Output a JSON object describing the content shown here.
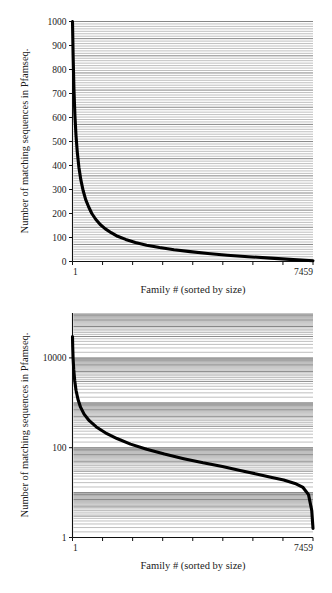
{
  "figure": {
    "panels": [
      {
        "id": "linear-panel",
        "chart_data": {
          "type": "line",
          "title": "",
          "xlabel": "Family # (sorted by size)",
          "ylabel": "Number of matching sequences in Pfamseq.",
          "yscale": "linear",
          "xlim": [
            1,
            7459
          ],
          "ylim": [
            0,
            1000
          ],
          "ytick_labels": [
            "1000",
            "900",
            "800",
            "700",
            "600",
            "500",
            "400",
            "300",
            "200",
            "100",
            "0"
          ],
          "ytick_values": [
            1000,
            900,
            800,
            700,
            600,
            500,
            400,
            300,
            200,
            100,
            0
          ],
          "xtick_labels": [
            "1",
            "7459"
          ],
          "xtick_values": [
            1,
            7459
          ],
          "grid": "horizontal",
          "legend": "none",
          "series": [
            {
              "name": "Pfam family size (rank-ordered)",
              "x": [
                1,
                20,
                45,
                75,
                110,
                150,
                200,
                260,
                330,
                410,
                500,
                600,
                720,
                860,
                1020,
                1200,
                1400,
                1650,
                1950,
                2300,
                2700,
                3150,
                3650,
                4200,
                4800,
                5450,
                6150,
                6850,
                7459
              ],
              "y": [
                1000,
                860,
                720,
                610,
                525,
                455,
                392,
                340,
                296,
                258,
                228,
                200,
                176,
                154,
                136,
                120,
                105,
                92,
                79,
                68,
                58,
                49,
                41,
                33,
                26,
                20,
                14,
                8,
                3
              ]
            }
          ]
        }
      },
      {
        "id": "log-panel",
        "chart_data": {
          "type": "line",
          "title": "",
          "xlabel": "Family # (sorted by size)",
          "ylabel": "Number of matching sequences in Pfamseq.",
          "yscale": "log",
          "xlim": [
            1,
            7459
          ],
          "ylim": [
            1,
            100000
          ],
          "ytick_labels": [
            "10000",
            "100",
            "1"
          ],
          "ytick_values": [
            10000,
            100,
            1
          ],
          "xtick_labels": [
            "1",
            "7459"
          ],
          "xtick_values": [
            1,
            7459
          ],
          "grid": "horizontal",
          "legend": "none",
          "series": [
            {
              "name": "Pfam family size (rank-ordered, log scale)",
              "x": [
                1,
                8,
                20,
                40,
                70,
                110,
                170,
                250,
                360,
                520,
                740,
                1020,
                1380,
                1800,
                2300,
                2850,
                3450,
                4050,
                4650,
                5200,
                5700,
                6150,
                6550,
                6900,
                7150,
                7320,
                7420,
                7459
              ],
              "y": [
                30000,
                17000,
                9500,
                5400,
                3100,
                1900,
                1200,
                800,
                560,
                400,
                290,
                215,
                160,
                120,
                92,
                72,
                57,
                46,
                38,
                31,
                26,
                22,
                19,
                16,
                13,
                9,
                4,
                1.6
              ]
            }
          ]
        }
      }
    ]
  }
}
